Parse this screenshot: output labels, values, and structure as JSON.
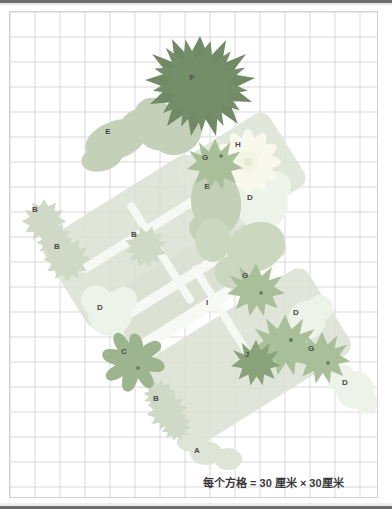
{
  "figure": {
    "kind": "garden-plot-plan",
    "caption": "每个方格 = 30 厘米 × 30厘米",
    "grid": {
      "cell_px": 25,
      "cols": 15,
      "rows": 19,
      "line_color": "#cfcfd4",
      "background": "#ffffff",
      "cell_real_size": "30 厘米 × 30厘米"
    },
    "border": {
      "frame_color": "#6e6e6e",
      "plot_border_color": "#cfcfd4"
    },
    "palette": {
      "bed_light": "#dfe4d8",
      "bed_light2": "#d9e0d2",
      "path_white": "#f4f6f2",
      "plant_A": "#dbe3d4",
      "plant_B": "#cfd9c6",
      "plant_C": "#9db58e",
      "plant_D": "#eef3ea",
      "plant_E": "#c3cfb7",
      "plant_F": "#6f8a64",
      "plant_G": "#a8bf99",
      "plant_H": "#f7f8ec",
      "plant_I": "#f2f4ee",
      "plant_J": "#88a37a",
      "label_text": "#4a4a4a"
    },
    "labels": [
      {
        "id": "F",
        "text": "F",
        "x": 191,
        "y": 76
      },
      {
        "id": "E1",
        "text": "E",
        "x": 107,
        "y": 130
      },
      {
        "id": "H",
        "text": "H",
        "x": 237,
        "y": 143
      },
      {
        "id": "G1",
        "text": "G",
        "x": 204,
        "y": 156
      },
      {
        "id": "E2",
        "text": "E",
        "x": 206,
        "y": 185
      },
      {
        "id": "D1",
        "text": "D",
        "x": 249,
        "y": 196
      },
      {
        "id": "B1",
        "text": "B",
        "x": 34,
        "y": 208
      },
      {
        "id": "B2",
        "text": "B",
        "x": 56,
        "y": 245
      },
      {
        "id": "B3",
        "text": "B",
        "x": 133,
        "y": 233
      },
      {
        "id": "G2",
        "text": "G",
        "x": 244,
        "y": 274
      },
      {
        "id": "D2",
        "text": "D",
        "x": 99,
        "y": 306
      },
      {
        "id": "I",
        "text": "I",
        "x": 206,
        "y": 301
      },
      {
        "id": "D3",
        "text": "D",
        "x": 295,
        "y": 311
      },
      {
        "id": "C",
        "text": "C",
        "x": 123,
        "y": 350
      },
      {
        "id": "J",
        "text": "J",
        "x": 246,
        "y": 353
      },
      {
        "id": "G3",
        "text": "G",
        "x": 310,
        "y": 347
      },
      {
        "id": "D4",
        "text": "D",
        "x": 344,
        "y": 381
      },
      {
        "id": "B4",
        "text": "B",
        "x": 155,
        "y": 397
      },
      {
        "id": "A",
        "text": "A",
        "x": 196,
        "y": 449
      }
    ],
    "legend": {
      "text": "每个方格 = 30 厘米 × 30厘米",
      "x": 202,
      "y": 483
    }
  }
}
